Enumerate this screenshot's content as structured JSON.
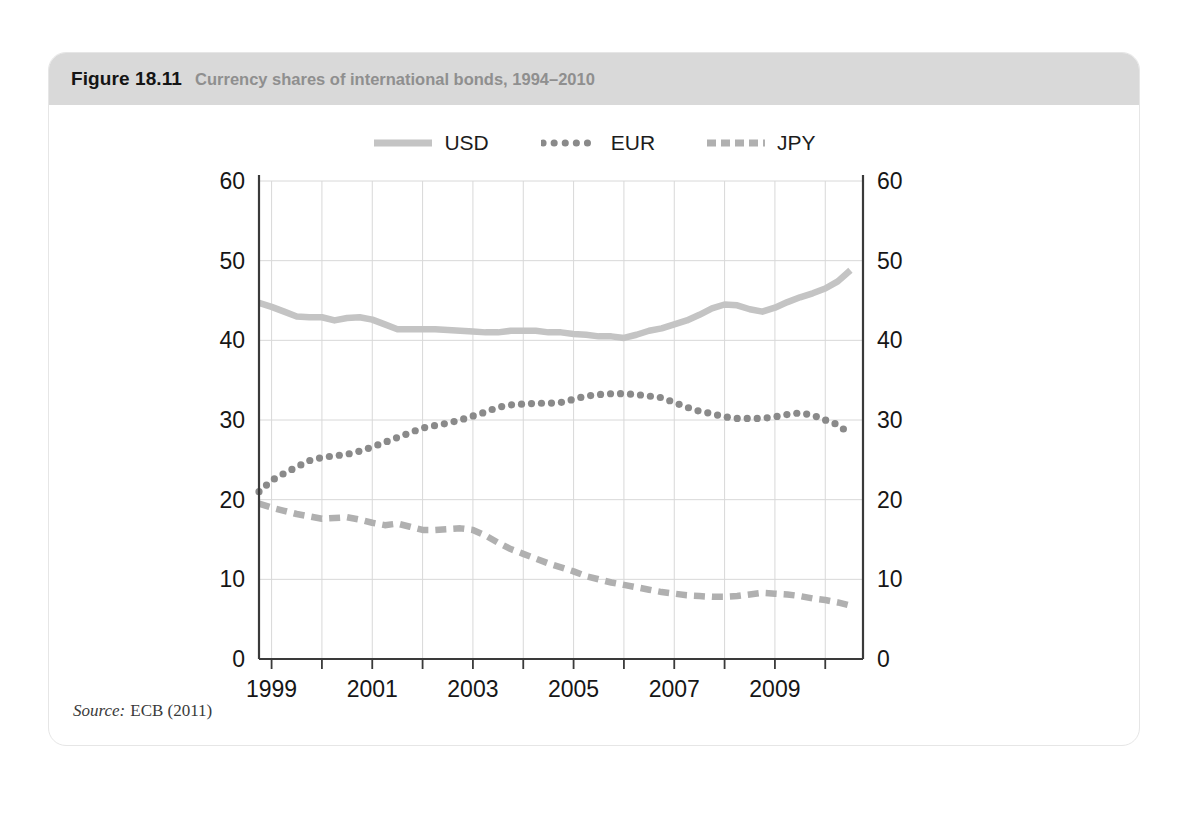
{
  "figure": {
    "label": "Figure 18.11",
    "caption": "Currency shares of international bonds, 1994–2010",
    "source_label": "Source:",
    "source_text": "ECB (2011)"
  },
  "legend": [
    {
      "name": "USD",
      "style": "solid",
      "color": "#c4c4c4"
    },
    {
      "name": "EUR",
      "style": "dotted",
      "color": "#8a8a8a"
    },
    {
      "name": "JPY",
      "style": "dashed",
      "color": "#b0b0b0"
    }
  ],
  "chart_data": {
    "type": "line",
    "title": "Currency shares of international bonds, 1994–2010",
    "xlabel": "",
    "ylabel": "",
    "ylim": [
      0,
      60
    ],
    "yticks": [
      0,
      10,
      20,
      30,
      40,
      50,
      60
    ],
    "xlim": [
      1998.75,
      2010.75
    ],
    "xticks_major": [
      1999,
      2001,
      2003,
      2005,
      2007,
      2009
    ],
    "xticks_minor": [
      2000,
      2002,
      2004,
      2006,
      2008,
      2010
    ],
    "grid": true,
    "dual_y_axis": true,
    "legend_position": "top-center",
    "x": [
      1998.75,
      1999.0,
      1999.25,
      1999.5,
      1999.75,
      2000.0,
      2000.25,
      2000.5,
      2000.75,
      2001.0,
      2001.25,
      2001.5,
      2001.75,
      2002.0,
      2002.25,
      2002.5,
      2002.75,
      2003.0,
      2003.25,
      2003.5,
      2003.75,
      2004.0,
      2004.25,
      2004.5,
      2004.75,
      2005.0,
      2005.25,
      2005.5,
      2005.75,
      2006.0,
      2006.25,
      2006.5,
      2006.75,
      2007.0,
      2007.25,
      2007.5,
      2007.75,
      2008.0,
      2008.25,
      2008.5,
      2008.75,
      2009.0,
      2009.25,
      2009.5,
      2009.75,
      2010.0,
      2010.25,
      2010.5
    ],
    "series": [
      {
        "name": "USD",
        "color": "#c4c4c4",
        "style": "solid",
        "values": [
          44.7,
          44.2,
          43.6,
          43.0,
          42.9,
          42.9,
          42.5,
          42.8,
          42.9,
          42.6,
          42.0,
          41.4,
          41.4,
          41.4,
          41.4,
          41.3,
          41.2,
          41.1,
          41.0,
          41.0,
          41.2,
          41.2,
          41.2,
          41.0,
          41.0,
          40.8,
          40.7,
          40.5,
          40.5,
          40.3,
          40.7,
          41.2,
          41.5,
          42.0,
          42.5,
          43.2,
          44.0,
          44.5,
          44.4,
          43.9,
          43.6,
          44.1,
          44.8,
          45.4,
          45.9,
          46.5,
          47.4,
          48.8
        ]
      },
      {
        "name": "EUR",
        "color": "#8a8a8a",
        "style": "dotted",
        "values": [
          21.0,
          22.4,
          23.3,
          24.1,
          24.9,
          25.3,
          25.5,
          25.7,
          26.1,
          26.6,
          27.2,
          27.8,
          28.4,
          29.0,
          29.3,
          29.6,
          30.0,
          30.5,
          31.0,
          31.6,
          31.9,
          32.0,
          32.1,
          32.1,
          32.2,
          32.6,
          33.0,
          33.2,
          33.3,
          33.3,
          33.2,
          33.0,
          32.8,
          32.2,
          31.6,
          31.1,
          30.8,
          30.4,
          30.2,
          30.2,
          30.2,
          30.4,
          30.7,
          30.9,
          30.6,
          30.0,
          29.4,
          28.2
        ]
      },
      {
        "name": "JPY",
        "color": "#b0b0b0",
        "style": "dashed",
        "values": [
          19.5,
          19.0,
          18.6,
          18.2,
          17.9,
          17.6,
          17.7,
          17.8,
          17.5,
          17.1,
          16.8,
          17.0,
          16.6,
          16.2,
          16.2,
          16.3,
          16.4,
          16.2,
          15.5,
          14.6,
          13.8,
          13.2,
          12.6,
          12.0,
          11.5,
          11.0,
          10.4,
          10.0,
          9.6,
          9.3,
          9.0,
          8.7,
          8.4,
          8.2,
          8.0,
          7.9,
          7.8,
          7.8,
          7.9,
          8.1,
          8.3,
          8.2,
          8.1,
          7.9,
          7.6,
          7.4,
          7.1,
          6.7
        ]
      }
    ]
  }
}
